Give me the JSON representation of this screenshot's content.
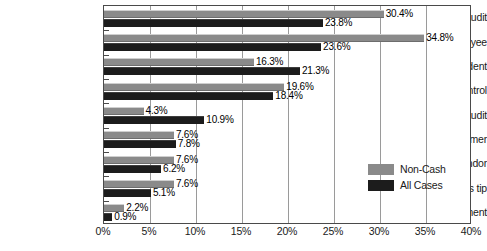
{
  "chart_data": {
    "type": "bar",
    "orientation": "horizontal",
    "title": "",
    "xlabel": "",
    "ylabel": "",
    "xlim": [
      0,
      40
    ],
    "xtick_labels": [
      "0%",
      "5%",
      "10%",
      "15%",
      "20%",
      "25%",
      "30%",
      "35%",
      "40%"
    ],
    "xticks": [
      0,
      5,
      10,
      15,
      20,
      25,
      30,
      35,
      40
    ],
    "grid": true,
    "grid_axis": "x",
    "legend_position": "inside-lower-right",
    "categories": [
      "Internal audit",
      "Tip from employee",
      "By accident",
      "Internal control",
      "External audit",
      "Tip from customer",
      "Tip from vendor",
      "Anonymous tip",
      "Law enforcement"
    ],
    "series": [
      {
        "name": "Non-Cash",
        "color": "#8a8a8a",
        "values": [
          30.4,
          34.8,
          16.3,
          19.6,
          4.3,
          7.6,
          7.6,
          7.6,
          2.2
        ],
        "labels": [
          "30.4%",
          "34.8%",
          "16.3%",
          "19.6%",
          "4.3%",
          "7.6%",
          "7.6%",
          "7.6%",
          "2.2%"
        ]
      },
      {
        "name": "All Cases",
        "color": "#1c1c1c",
        "values": [
          23.8,
          23.6,
          21.3,
          18.4,
          10.9,
          7.8,
          6.2,
          5.1,
          0.9
        ],
        "labels": [
          "23.8%",
          "23.6%",
          "21.3%",
          "18.4%",
          "10.9%",
          "7.8%",
          "6.2%",
          "5.1%",
          "0.9%"
        ]
      }
    ]
  },
  "legend": {
    "items": [
      {
        "label": "Non-Cash",
        "color": "#8a8a8a"
      },
      {
        "label": "All Cases",
        "color": "#1c1c1c"
      }
    ]
  }
}
